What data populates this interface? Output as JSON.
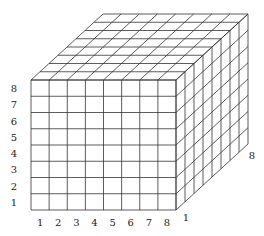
{
  "diagram": {
    "type": "cube-grid",
    "grid_size": 8,
    "line_color": "#333333",
    "background": "#ffffff",
    "front_face": {
      "x0": 31,
      "y0": 80,
      "x1": 176,
      "y1": 210
    },
    "depth_offset": {
      "dx": 72,
      "dy": -66
    },
    "labels": {
      "left_vertical": [
        "1",
        "2",
        "3",
        "4",
        "5",
        "6",
        "7",
        "8"
      ],
      "bottom_horizontal": [
        "1",
        "2",
        "3",
        "4",
        "5",
        "6",
        "7",
        "8"
      ],
      "depth_start": "1",
      "depth_end": "8"
    }
  }
}
